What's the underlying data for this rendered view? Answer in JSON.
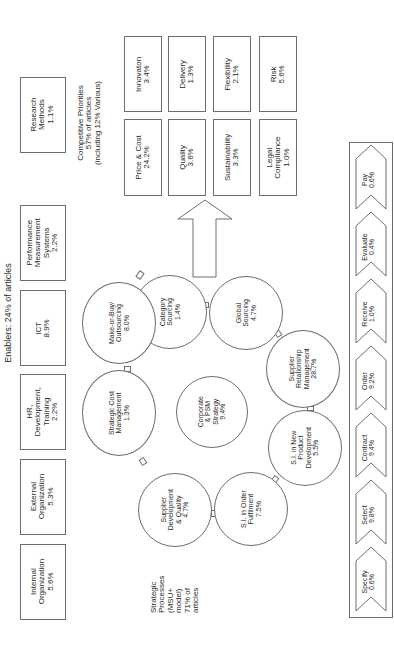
{
  "enablers": {
    "heading": "Enablers: 24% of articles",
    "items": [
      {
        "label": "Internal\nOrganization\n5.6%"
      },
      {
        "label": "External\nOrganization\n5.3%"
      },
      {
        "label": "HR,\nDevelopment,\nTraining\n2.2%"
      },
      {
        "label": "ICT\n8.9%"
      },
      {
        "label": "Performance\nMeasurement\nSystems\n2.2%"
      }
    ]
  },
  "research_methods": {
    "label": "Research\nMethods\n1.1%"
  },
  "competitive_priorities": {
    "heading": "Competitive Priorities\n57% of articles\n(including 12% Various)",
    "items": [
      {
        "label": "Innovaton\n3.4%"
      },
      {
        "label": "Delivery\n1.3%"
      },
      {
        "label": "Flexibility\n2.1%"
      },
      {
        "label": "Risk\n5.6%"
      },
      {
        "label": "Price & Cost\n24.2%"
      },
      {
        "label": "Quality\n3.6%"
      },
      {
        "label": "Sustainability\n3.3%"
      },
      {
        "label": "Legal\nCompliance\n1.0%"
      }
    ]
  },
  "strategic_processes": {
    "heading": "Strategic\nProcesses\n(MSU+\nmodel)\n71% of\narticles",
    "center": {
      "label": "Corporate\n& PSM\nStrategy\n9.4%"
    },
    "ring": [
      {
        "label": "Category\nSourcing\n1.4%"
      },
      {
        "label": "Global\nSourcing\n4.7%"
      },
      {
        "label": "Supplier\nRelationship\nManagement\n28.7%"
      },
      {
        "label": "S.I. in New\nProduct\nDevelopment\n5.5%"
      },
      {
        "label": "S.I. in Order\nFulfilment\n7.5%"
      },
      {
        "label": "Supplier\nDevelopment\n& Quality\n4.7%"
      },
      {
        "label": "Strategic Cost\nManagement\n1.3%"
      },
      {
        "label": "Make-or-Buy/\nOutsourcing\n8.0%"
      }
    ]
  },
  "operational_processes": {
    "steps": [
      {
        "label": "Specify\n0.6%"
      },
      {
        "label": "Select\n9.8%"
      },
      {
        "label": "Contract\n9.4%"
      },
      {
        "label": "Order\n9.2%"
      },
      {
        "label": "Receive\n1.0%"
      },
      {
        "label": "Evaluate\n0.4%"
      },
      {
        "label": "Pay\n0.6%"
      }
    ]
  },
  "colors": {
    "line": "#6e6e6e",
    "text": "#2a2a2a",
    "background": "#ffffff"
  }
}
